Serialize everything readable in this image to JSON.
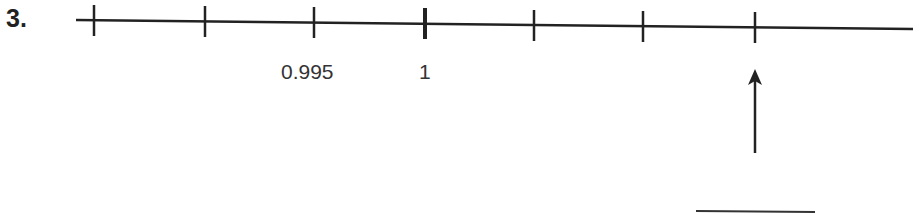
{
  "problem": {
    "number": "3.",
    "number_line": {
      "tick_count": 7,
      "labels": [
        {
          "tick_index": 2,
          "text": "0.995"
        },
        {
          "tick_index": 3,
          "text": "1"
        }
      ],
      "emphasized_tick_index": 3,
      "arrow_tick_index": 6,
      "answer_blank": ""
    }
  }
}
